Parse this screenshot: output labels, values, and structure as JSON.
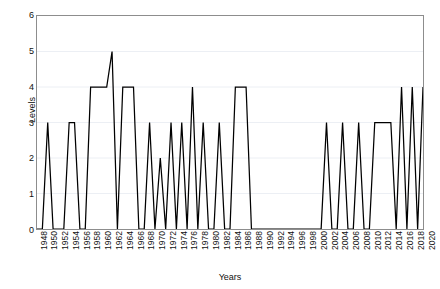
{
  "chart_data": {
    "type": "line",
    "title": "",
    "xlabel": "Years",
    "ylabel": "Levels",
    "xlim": [
      1948,
      2020
    ],
    "ylim": [
      0,
      6
    ],
    "yticks": [
      0,
      1,
      2,
      3,
      4,
      5,
      6
    ],
    "xtick_step": 2,
    "grid": true,
    "legend": "none",
    "line_color": "#000000",
    "frame_color": "#8d8d8d",
    "grid_color": "#eceff4",
    "background": "#ffffff",
    "x": [
      1948,
      1949,
      1950,
      1951,
      1952,
      1953,
      1954,
      1955,
      1956,
      1957,
      1958,
      1959,
      1960,
      1961,
      1962,
      1963,
      1964,
      1965,
      1966,
      1967,
      1968,
      1969,
      1970,
      1971,
      1972,
      1973,
      1974,
      1975,
      1976,
      1977,
      1978,
      1979,
      1980,
      1981,
      1982,
      1983,
      1984,
      1985,
      1986,
      1987,
      1988,
      1989,
      1990,
      1991,
      1992,
      1993,
      1994,
      1995,
      1996,
      1997,
      1998,
      1999,
      2000,
      2001,
      2002,
      2003,
      2004,
      2005,
      2006,
      2007,
      2008,
      2009,
      2010,
      2011,
      2012,
      2013,
      2014,
      2015,
      2016,
      2017,
      2018,
      2019,
      2020
    ],
    "values": [
      0,
      0,
      3,
      0,
      0,
      0,
      3,
      3,
      0,
      0,
      4,
      4,
      4,
      4,
      5,
      0,
      4,
      4,
      4,
      0,
      0,
      3,
      0,
      2,
      0,
      3,
      0,
      3,
      0,
      4,
      0,
      3,
      0,
      0,
      3,
      0,
      0,
      4,
      4,
      4,
      0,
      0,
      0,
      0,
      0,
      0,
      0,
      0,
      0,
      0,
      0,
      0,
      0,
      0,
      3,
      0,
      0,
      3,
      0,
      0,
      3,
      0,
      0,
      3,
      3,
      3,
      3,
      0,
      4,
      0,
      4,
      0,
      4
    ],
    "xticklabels": [
      "1948",
      "1950",
      "1952",
      "1954",
      "1956",
      "1958",
      "1960",
      "1962",
      "1964",
      "1966",
      "1968",
      "1970",
      "1972",
      "1974",
      "1976",
      "1978",
      "1980",
      "1982",
      "1984",
      "1986",
      "1988",
      "1990",
      "1992",
      "1994",
      "1996",
      "1998",
      "2000",
      "2002",
      "2004",
      "2006",
      "2008",
      "2010",
      "2012",
      "2014",
      "2016",
      "2018",
      "2020"
    ],
    "yticklabels": [
      "0",
      "1",
      "2",
      "3",
      "4",
      "5",
      "6"
    ]
  }
}
